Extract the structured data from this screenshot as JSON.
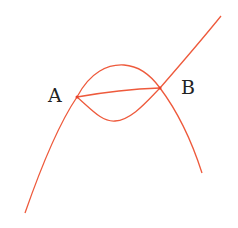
{
  "diagram": {
    "type": "curves-intersection",
    "stroke_color": "#ee5a3c",
    "labels": {
      "A": "A",
      "B": "B"
    },
    "points": {
      "A": [
        77,
        97
      ],
      "B": [
        160,
        88
      ]
    },
    "curves": [
      {
        "name": "rising-curve",
        "description": "curve from lower-left through A and B to upper-right"
      },
      {
        "name": "parabola-arc",
        "description": "downward-opening arc through A, peaking above, passing B and descending right"
      },
      {
        "name": "lower-arc",
        "description": "arc from A dipping below to B"
      },
      {
        "name": "chord-AB",
        "description": "line segment from A to B"
      }
    ]
  }
}
